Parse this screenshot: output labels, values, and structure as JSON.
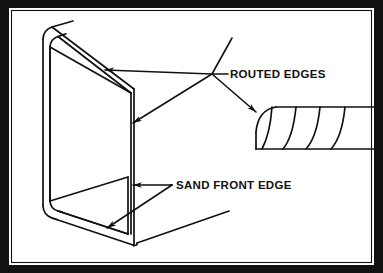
{
  "figure": {
    "kind": "technical-line-drawing",
    "frame_color": "#111111",
    "line_color": "#111111",
    "background_color": "#ffffff"
  },
  "labels": {
    "routed_edges": "ROUTED EDGES",
    "sand_front_edge": "SAND FRONT EDGE"
  },
  "callouts": [
    {
      "id": "routed-edges",
      "text": "ROUTED EDGES",
      "target_count": 3,
      "targets": [
        "top-back-edge",
        "front-corner-edge",
        "edge-profile-detail"
      ]
    },
    {
      "id": "sand-front-edge",
      "text": "SAND FRONT EDGE",
      "target_count": 2,
      "targets": [
        "front-corner-edge-lower",
        "bottom-front-edge"
      ]
    }
  ],
  "detail_view": {
    "name": "routed-edge-profile",
    "description": "Rounded-over edge profile with concentric contour lines",
    "contour_count": 4
  }
}
